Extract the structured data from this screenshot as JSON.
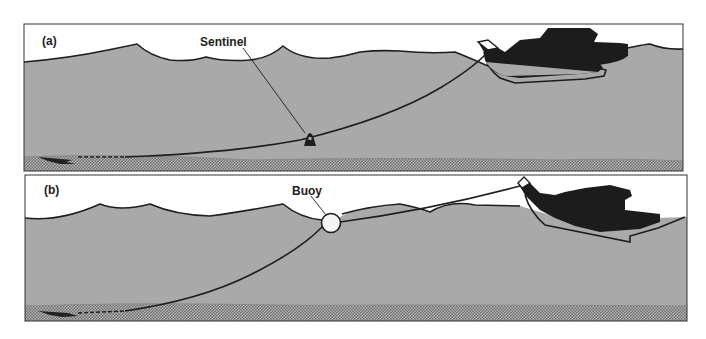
{
  "figure": {
    "panel_a": {
      "tag": "(a)",
      "callout": "Sentinel"
    },
    "panel_b": {
      "tag": "(b)",
      "callout": "Buoy"
    }
  },
  "colors": {
    "sky": "#ffffff",
    "water": "#a9a9a9",
    "seabed": "#8f8f8f",
    "line": "#1e1e1e",
    "boat": "#1c1c1c"
  }
}
